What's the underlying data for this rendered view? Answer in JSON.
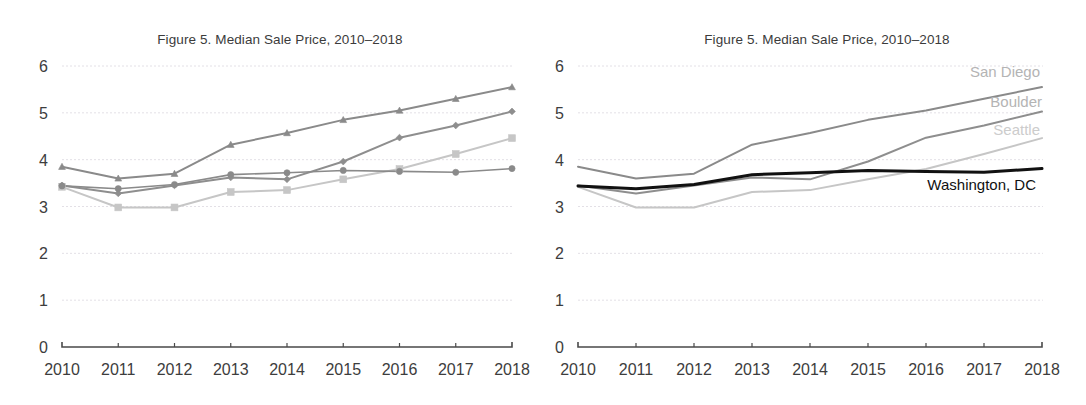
{
  "figure": {
    "title": "Figure 5. Median Sale Price, 2010–2018",
    "panel_count": 2,
    "background_color": "#ffffff"
  },
  "panels": [
    {
      "id": "left",
      "title": "Figure 5. Median Sale Price, 2010–2018",
      "markers_visible": true,
      "labels_visible": false
    },
    {
      "id": "right",
      "title": "Figure 5. Median Sale Price, 2010–2018",
      "markers_visible": false,
      "labels_visible": true
    }
  ],
  "axes": {
    "y_ticks": [
      "0",
      "1",
      "2",
      "3",
      "4",
      "5",
      "6"
    ],
    "x_ticks": [
      "2010",
      "2011",
      "2012",
      "2013",
      "2014",
      "2015",
      "2016",
      "2017",
      "2018"
    ],
    "y_min": 0,
    "y_max": 6,
    "grid": true,
    "grid_color": "#e3e0e6",
    "axis_color": "#4a4a4a"
  },
  "series_labels": {
    "san_diego": "San Diego",
    "boulder": "Boulder",
    "seattle": "Seattle",
    "washington_dc": "Washington, DC"
  },
  "chart_data": {
    "type": "line",
    "title": "Figure 5. Median Sale Price, 2010–2018",
    "xlabel": "",
    "ylabel": "",
    "x": [
      2010,
      2011,
      2012,
      2013,
      2014,
      2015,
      2016,
      2017,
      2018
    ],
    "ylim": [
      0,
      6
    ],
    "xlim": [
      2010,
      2018
    ],
    "grid": true,
    "legend_position": "right-inline-labels",
    "series": [
      {
        "name": "San Diego",
        "values": [
          3.85,
          3.6,
          3.7,
          4.32,
          4.57,
          4.85,
          5.05,
          5.3,
          5.55
        ],
        "color": "#8a8a8a",
        "label_color": "#b4b4b4",
        "width": 2.0,
        "marker": "triangle"
      },
      {
        "name": "Boulder",
        "values": [
          3.45,
          3.28,
          3.45,
          3.62,
          3.58,
          3.96,
          4.47,
          4.73,
          5.03
        ],
        "color": "#8e8e8e",
        "label_color": "#b4b4b4",
        "width": 2.0,
        "marker": "diamond"
      },
      {
        "name": "Seattle",
        "values": [
          3.42,
          2.98,
          2.98,
          3.31,
          3.35,
          3.58,
          3.8,
          4.12,
          4.46
        ],
        "color": "#c6c6c6",
        "label_color": "#cccccc",
        "width": 2.0,
        "marker": "square"
      },
      {
        "name": "Washington, DC",
        "values": [
          3.44,
          3.38,
          3.47,
          3.68,
          3.72,
          3.77,
          3.75,
          3.73,
          3.81
        ],
        "color": "#8a8a8a",
        "label_color": "#111111",
        "width": 1.6,
        "marker": "circle",
        "highlight_color": "#111111",
        "highlight_width": 3.0
      }
    ]
  },
  "series_label_positions": [
    {
      "name": "San Diego",
      "x": 1040,
      "y": 77,
      "anchor": "end"
    },
    {
      "name": "Boulder",
      "x": 1042,
      "y": 107,
      "anchor": "end"
    },
    {
      "name": "Seattle",
      "x": 1040,
      "y": 135,
      "anchor": "end"
    },
    {
      "name": "Washington, DC",
      "x": 1036,
      "y": 190,
      "anchor": "end"
    }
  ]
}
